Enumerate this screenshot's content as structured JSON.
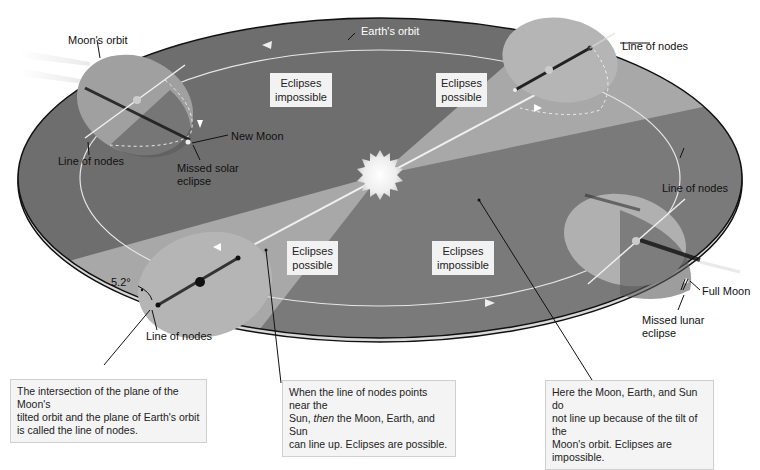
{
  "diagram": {
    "colors": {
      "plane_dark": "#6e6e6e",
      "plane_mid": "#8a8a8a",
      "plane_light": "#a9a9a9",
      "orbit_line": "#e6e6e6",
      "outline": "#111111",
      "sun": "#f7f7f7"
    },
    "labels": {
      "moons_orbit": "Moon's orbit",
      "earths_orbit": "Earth's orbit",
      "line_of_nodes_top_left": "Line of nodes",
      "line_of_nodes_top_right": "Line of nodes",
      "line_of_nodes_right": "Line of nodes",
      "line_of_nodes_bottom": "Line of nodes",
      "new_moon": "New Moon",
      "missed_solar_eclipse_line1": "Missed solar",
      "missed_solar_eclipse_line2": "eclipse",
      "full_moon": "Full Moon",
      "missed_lunar_eclipse_line1": "Missed lunar",
      "missed_lunar_eclipse_line2": "eclipse",
      "tilt_angle": "5.2°"
    },
    "zones": [
      {
        "line1": "Eclipses",
        "line2": "impossible"
      },
      {
        "line1": "Eclipses",
        "line2": "possible"
      },
      {
        "line1": "Eclipses",
        "line2": "possible"
      },
      {
        "line1": "Eclipses",
        "line2": "impossible"
      }
    ],
    "captions": {
      "left": {
        "line1": "The intersection of the plane of the Moon's",
        "line2": "tilted orbit and the plane of Earth's orbit",
        "line3": "is called the line of nodes."
      },
      "middle": {
        "line1": "When the line of nodes points near the",
        "line2_pre": "Sun, ",
        "line2_italic": "then",
        "line2_post": " the Moon, Earth, and Sun",
        "line3": "can line up. Eclipses are possible."
      },
      "right": {
        "line1": "Here the Moon, Earth, and Sun do",
        "line2": "not line up because of the tilt of the",
        "line3": "Moon's orbit. Eclipses are impossible."
      }
    }
  }
}
